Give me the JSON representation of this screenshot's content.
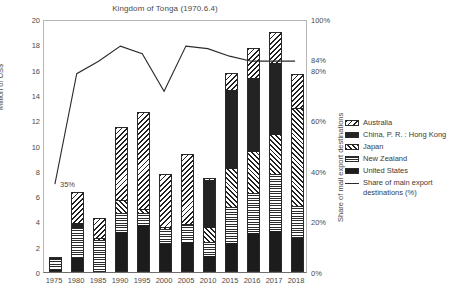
{
  "chart_data": {
    "type": "bar",
    "title": "Kingdom of Tonga (1970.6.4)",
    "xlabel": "",
    "ylabel": "Million of US$",
    "y2label": "Share of mail export destinations",
    "ylim": [
      0,
      20
    ],
    "y2lim": [
      0,
      100
    ],
    "grid": false,
    "legend_position": "right",
    "categories": [
      "1975",
      "1980",
      "1985",
      "1990",
      "1995",
      "2000",
      "2005",
      "2010",
      "2015",
      "2016",
      "2017",
      "2018"
    ],
    "y_ticks": [
      "0",
      "2",
      "4",
      "6",
      "8",
      "10",
      "12",
      "14",
      "16",
      "18",
      "20"
    ],
    "y2_ticks": [
      "0%",
      "20%",
      "40%",
      "60%",
      "80%",
      "100%"
    ],
    "y2_extra_tick": "84%",
    "annotation": "35%",
    "series": [
      {
        "name": "United States",
        "pattern": "solid-black",
        "values": [
          0.15,
          1.1,
          0.1,
          3.2,
          3.75,
          2.25,
          2.4,
          1.3,
          2.3,
          3.05,
          3.25,
          2.7
        ]
      },
      {
        "name": "New Zealand",
        "pattern": "horizontal",
        "values": [
          0.85,
          2.35,
          2.45,
          1.45,
          0.95,
          1.15,
          1.3,
          1.05,
          2.85,
          3.2,
          4.5,
          2.55
        ]
      },
      {
        "name": "Japan",
        "pattern": "diagonal",
        "values": [
          0.05,
          0.05,
          0.05,
          0.95,
          0.2,
          0.1,
          0.05,
          1.1,
          3.0,
          3.2,
          3.05,
          7.65
        ]
      },
      {
        "name": "China, P. R. : Hong Kong",
        "pattern": "solid-dark",
        "values": [
          0.05,
          0.4,
          0.05,
          0.1,
          0.05,
          0.05,
          0.05,
          3.85,
          6.2,
          5.85,
          5.75,
          0.1
        ]
      },
      {
        "name": "Australia",
        "pattern": "cross-hatch",
        "values": [
          0.1,
          2.4,
          1.65,
          5.75,
          7.7,
          4.2,
          5.5,
          0.15,
          1.35,
          2.4,
          2.45,
          2.65
        ]
      }
    ],
    "line_series": {
      "name": "Share of main export destinations (%)",
      "values": [
        35,
        79,
        84,
        90,
        87,
        72,
        90,
        89,
        86,
        84,
        84,
        84
      ]
    },
    "totals": [
      1.2,
      6.3,
      4.3,
      11.45,
      12.65,
      7.75,
      9.3,
      7.45,
      15.7,
      17.7,
      19.0,
      15.65
    ]
  },
  "legend": {
    "items": [
      {
        "label": "Australia",
        "swatch": "cross-hatch"
      },
      {
        "label": "China, P. R. : Hong Kong",
        "swatch": "solid-dark"
      },
      {
        "label": "Japan",
        "swatch": "diagonal"
      },
      {
        "label": "New Zealand",
        "swatch": "horizontal"
      },
      {
        "label": "United States",
        "swatch": "solid-black"
      },
      {
        "label": "Share of main export destinations (%)",
        "swatch": "line"
      }
    ]
  },
  "colors": {
    "axis": "#b6b6b6",
    "text": "#3b3b3b",
    "line": "#2a2a2a",
    "bar_dark": "#1c1c1c"
  }
}
